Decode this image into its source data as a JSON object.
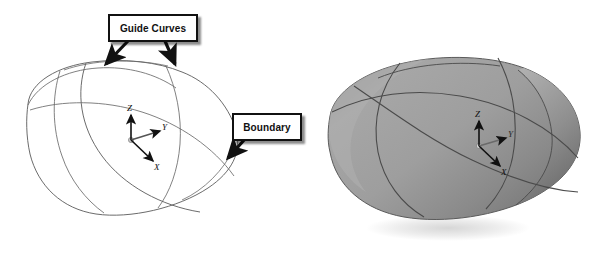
{
  "figure": {
    "background_color": "#ffffff",
    "panels": [
      {
        "id": "wireframe",
        "name": "wireframe-panel",
        "render_style": "wireframe",
        "curve_color": "#555555",
        "fill_color": "#ffffff",
        "axis_triad": {
          "name": "coordinate-axis-triad",
          "origin_label": "",
          "axes": [
            {
              "label": "Z",
              "direction": "up"
            },
            {
              "label": "Y",
              "direction": "upper-right"
            },
            {
              "label": "X",
              "direction": "lower-right"
            }
          ]
        }
      },
      {
        "id": "shaded",
        "name": "shaded-panel",
        "render_style": "shaded",
        "surface_color": "#9a9a9a",
        "surface_highlight_color": "#c2c2c2",
        "surface_shadow_color": "#6e6e6e",
        "edge_color": "#4a4a4a",
        "ground_shadow_color": "#e2e2e2",
        "axis_triad": {
          "name": "coordinate-axis-triad",
          "origin_label": "",
          "axes": [
            {
              "label": "Z",
              "direction": "up"
            },
            {
              "label": "Y",
              "direction": "upper-right"
            },
            {
              "label": "X",
              "direction": "lower-right"
            }
          ]
        }
      }
    ],
    "callouts": [
      {
        "id": "guide-curves",
        "label": "Guide Curves",
        "box": {
          "x": 108,
          "y": 14,
          "width": 86,
          "height": 24
        },
        "border_color": "#111111",
        "text_color": "#111111",
        "fill_color": "#ffffff",
        "shadow": true,
        "arrows": 2,
        "arrow_targets": [
          "left-guide-curve",
          "right-guide-curve"
        ]
      },
      {
        "id": "boundary",
        "label": "Boundary",
        "box": {
          "x": 232,
          "y": 113,
          "width": 66,
          "height": 24
        },
        "border_color": "#111111",
        "text_color": "#111111",
        "fill_color": "#ffffff",
        "shadow": true,
        "arrows": 1,
        "arrow_targets": [
          "boundary-outline-curve"
        ]
      }
    ]
  },
  "axis_labels": {
    "z": "Z",
    "y": "Y",
    "x": "X"
  }
}
